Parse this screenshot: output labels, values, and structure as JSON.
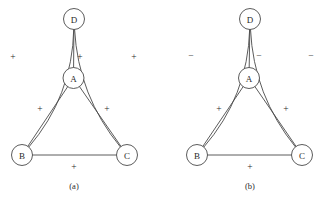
{
  "figure": {
    "background_color": "#ffffff",
    "stroke_color": "#4a4a4a",
    "text_color": "#2b2b2b",
    "panels": [
      {
        "id": "panel-a",
        "caption": "(a)",
        "caption_pos": {
          "x": 74,
          "y": 186
        },
        "nodes": [
          {
            "id": "D",
            "label": "D",
            "cx": 74,
            "cy": 19,
            "r": 10.5
          },
          {
            "id": "A",
            "label": "A",
            "cx": 73.5,
            "cy": 78,
            "r": 10.5
          },
          {
            "id": "B",
            "label": "B",
            "cx": 22,
            "cy": 155,
            "r": 10.5
          },
          {
            "id": "C",
            "label": "C",
            "cx": 127,
            "cy": 155,
            "r": 10.5
          }
        ],
        "edges": [
          {
            "id": "D-A",
            "from": "D",
            "to": "A",
            "sign": "+",
            "sign_pos": {
              "x": 80,
              "y": 57
            },
            "curved": false
          },
          {
            "id": "D-B",
            "from": "D",
            "to": "B",
            "sign": "+",
            "sign_pos": {
              "x": 13,
              "y": 57
            },
            "curved": true,
            "bulge": -26
          },
          {
            "id": "D-C",
            "from": "D",
            "to": "C",
            "sign": "+",
            "sign_pos": {
              "x": 134,
              "y": 57
            },
            "curved": true,
            "bulge": 24
          },
          {
            "id": "A-B",
            "from": "A",
            "to": "B",
            "sign": "+",
            "sign_pos": {
              "x": 40,
              "y": 109
            },
            "curved": false
          },
          {
            "id": "A-C",
            "from": "A",
            "to": "C",
            "sign": "+",
            "sign_pos": {
              "x": 107,
              "y": 109
            },
            "curved": false
          },
          {
            "id": "B-C",
            "from": "B",
            "to": "C",
            "sign": "+",
            "sign_pos": {
              "x": 74,
              "y": 167
            },
            "curved": false
          }
        ]
      },
      {
        "id": "panel-b",
        "caption": "(b)",
        "caption_pos": {
          "x": 250,
          "y": 186
        },
        "nodes": [
          {
            "id": "D",
            "label": "D",
            "cx": 250,
            "cy": 19,
            "r": 10.5
          },
          {
            "id": "A",
            "label": "A",
            "cx": 249,
            "cy": 78,
            "r": 10.5
          },
          {
            "id": "B",
            "label": "B",
            "cx": 197,
            "cy": 155,
            "r": 10.5
          },
          {
            "id": "C",
            "label": "C",
            "cx": 302,
            "cy": 155,
            "r": 10.5
          }
        ],
        "edges": [
          {
            "id": "D-A",
            "from": "D",
            "to": "A",
            "sign": "−",
            "sign_pos": {
              "x": 259,
              "y": 56
            },
            "curved": false
          },
          {
            "id": "D-B",
            "from": "D",
            "to": "B",
            "sign": "−",
            "sign_pos": {
              "x": 191,
              "y": 56
            },
            "curved": true,
            "bulge": -26
          },
          {
            "id": "D-C",
            "from": "D",
            "to": "C",
            "sign": "−",
            "sign_pos": {
              "x": 311,
              "y": 56
            },
            "curved": true,
            "bulge": 24
          },
          {
            "id": "A-B",
            "from": "A",
            "to": "B",
            "sign": "+",
            "sign_pos": {
              "x": 219,
              "y": 109
            },
            "curved": false
          },
          {
            "id": "A-C",
            "from": "A",
            "to": "C",
            "sign": "+",
            "sign_pos": {
              "x": 286,
              "y": 109
            },
            "curved": false
          },
          {
            "id": "B-C",
            "from": "B",
            "to": "C",
            "sign": "+",
            "sign_pos": {
              "x": 250,
              "y": 167
            },
            "curved": false
          }
        ]
      }
    ]
  }
}
